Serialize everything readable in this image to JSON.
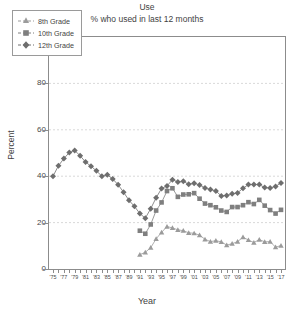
{
  "chart": {
    "title": "Use",
    "subtitle": "% who used in last 12 months",
    "xlabel": "Year",
    "ylabel": "Percent"
  },
  "legend": {
    "position": "top-left",
    "items": [
      {
        "label": "8th Grade",
        "marker": "triangle-marker",
        "color": "#9b9b9b"
      },
      {
        "label": "10th Grade",
        "marker": "square-marker",
        "color": "#7f7f7f"
      },
      {
        "label": "12th Grade",
        "marker": "diamond-marker",
        "color": "#6e6e6e"
      }
    ]
  },
  "axes": {
    "y_ticks": [
      "0",
      "20",
      "40",
      "60",
      "80",
      "100"
    ],
    "x_ticks": [
      "'75",
      "'77",
      "'79",
      "'81",
      "'83",
      "'85",
      "'87",
      "'89",
      "'91",
      "'93",
      "'95",
      "'97",
      "'99",
      "'01",
      "'03",
      "'05",
      "'07",
      "'09",
      "'11",
      "'13",
      "'15",
      "'17"
    ]
  },
  "chart_data": {
    "type": "line",
    "title": "Use",
    "subtitle": "% who used in last 12 months",
    "xlabel": "Year",
    "ylabel": "Percent",
    "xlim": [
      1975,
      2017
    ],
    "ylim": [
      0,
      100
    ],
    "grid": true,
    "grid_axis": "y",
    "legend_position": "top-left",
    "x": [
      1975,
      1976,
      1977,
      1978,
      1979,
      1980,
      1981,
      1982,
      1983,
      1984,
      1985,
      1986,
      1987,
      1988,
      1989,
      1990,
      1991,
      1992,
      1993,
      1994,
      1995,
      1996,
      1997,
      1998,
      1999,
      2000,
      2001,
      2002,
      2003,
      2004,
      2005,
      2006,
      2007,
      2008,
      2009,
      2010,
      2011,
      2012,
      2013,
      2014,
      2015,
      2016,
      2017
    ],
    "series": [
      {
        "name": "8th Grade",
        "marker": "triangle",
        "color": "#9b9b9b",
        "values": [
          null,
          null,
          null,
          null,
          null,
          null,
          null,
          null,
          null,
          null,
          null,
          null,
          null,
          null,
          null,
          null,
          6.2,
          7.2,
          9.2,
          13.0,
          15.8,
          18.3,
          17.7,
          16.9,
          16.5,
          15.6,
          15.4,
          14.6,
          12.8,
          11.8,
          12.2,
          11.7,
          10.3,
          10.9,
          11.8,
          13.7,
          12.5,
          11.4,
          12.7,
          11.7,
          11.8,
          9.4,
          10.1
        ]
      },
      {
        "name": "10th Grade",
        "marker": "square",
        "color": "#7f7f7f",
        "values": [
          null,
          null,
          null,
          null,
          null,
          null,
          null,
          null,
          null,
          null,
          null,
          null,
          null,
          null,
          null,
          null,
          16.5,
          15.2,
          19.2,
          25.2,
          28.7,
          33.6,
          34.8,
          31.1,
          32.1,
          32.2,
          32.7,
          30.3,
          28.2,
          27.5,
          26.6,
          25.2,
          24.6,
          26.7,
          26.7,
          27.5,
          28.8,
          28.0,
          29.8,
          27.3,
          25.4,
          23.9,
          25.5
        ]
      },
      {
        "name": "12th Grade",
        "marker": "diamond",
        "color": "#6e6e6e",
        "values": [
          40.0,
          44.5,
          47.6,
          50.2,
          51.1,
          48.8,
          46.1,
          44.3,
          42.3,
          40.0,
          40.6,
          38.8,
          36.3,
          33.1,
          29.6,
          27.0,
          23.9,
          21.9,
          26.0,
          30.7,
          34.7,
          35.8,
          38.5,
          37.5,
          37.8,
          36.5,
          37.0,
          36.2,
          34.9,
          34.3,
          33.6,
          31.5,
          31.7,
          32.4,
          32.8,
          34.8,
          36.4,
          36.4,
          36.4,
          35.1,
          34.9,
          35.6,
          37.1
        ]
      }
    ]
  }
}
